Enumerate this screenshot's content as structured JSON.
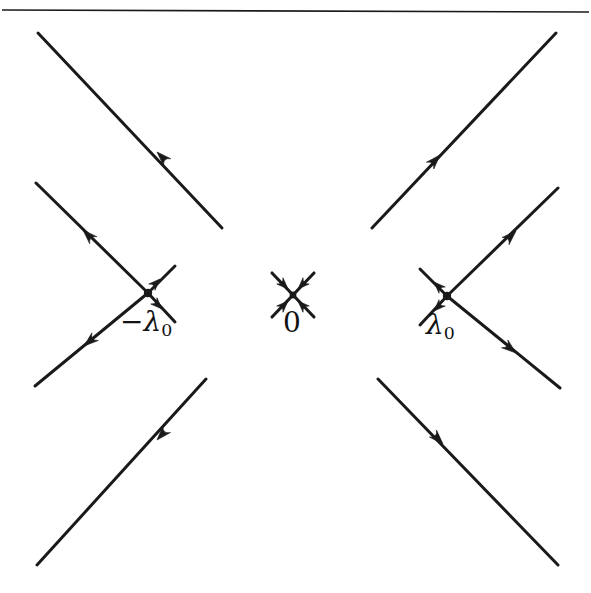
{
  "figure": {
    "type": "phase-line-diagram",
    "background_color": "#ffffff",
    "stroke_color": "#1a1a1a",
    "canvas": {
      "width": 591,
      "height": 593
    },
    "top_rule": {
      "name": "top-horizontal-rule",
      "x1": 2,
      "y1": 10,
      "x2": 589,
      "y2": 12,
      "thickness": 1.6
    }
  },
  "labels": {
    "neg_lambda": {
      "minus": "−",
      "lambda": "λ",
      "sub": "0",
      "text": "−λ₀"
    },
    "zero": {
      "text": "0"
    },
    "pos_lambda": {
      "lambda": "λ",
      "sub": "0",
      "text": "λ₀"
    }
  },
  "chart_data": {
    "type": "scatter",
    "title": "",
    "xlabel": "",
    "ylabel": "",
    "singular_points": [
      {
        "name": "-lambda0",
        "label": "−λ₀",
        "x": 148,
        "y": 293,
        "kind": "saddle"
      },
      {
        "name": "zero",
        "label": "0",
        "x": 293,
        "y": 295,
        "kind": "stable-node"
      },
      {
        "name": "lambda0",
        "label": "λ₀",
        "x": 447,
        "y": 296,
        "kind": "saddle"
      }
    ],
    "lines": [
      {
        "name": "upper-left-outer",
        "x1": 38,
        "y1": 33,
        "x2": 222,
        "y2": 228
      },
      {
        "name": "left-upper-arm",
        "x1": 36,
        "y1": 183,
        "x2": 148,
        "y2": 293
      },
      {
        "name": "left-lower-arm",
        "x1": 148,
        "y1": 293,
        "x2": 35,
        "y2": 386
      },
      {
        "name": "lower-left-outer",
        "x1": 206,
        "y1": 379,
        "x2": 37,
        "y2": 565
      },
      {
        "name": "upper-right-outer",
        "x1": 556,
        "y1": 33,
        "x2": 372,
        "y2": 228
      },
      {
        "name": "right-upper-arm",
        "x1": 558,
        "y1": 188,
        "x2": 447,
        "y2": 296
      },
      {
        "name": "right-lower-arm",
        "x1": 447,
        "y1": 296,
        "x2": 560,
        "y2": 388
      },
      {
        "name": "lower-right-outer",
        "x1": 378,
        "y1": 379,
        "x2": 558,
        "y2": 565
      },
      {
        "name": "center-cross-nw-se",
        "x1": 272,
        "y1": 273,
        "x2": 314,
        "y2": 317
      },
      {
        "name": "center-cross-ne-sw",
        "x1": 314,
        "y1": 273,
        "x2": 272,
        "y2": 317
      },
      {
        "name": "left-point-stub-ne",
        "x1": 148,
        "y1": 293,
        "x2": 175,
        "y2": 266
      },
      {
        "name": "left-point-stub-se",
        "x1": 148,
        "y1": 293,
        "x2": 175,
        "y2": 322
      },
      {
        "name": "right-point-stub-nw",
        "x1": 447,
        "y1": 296,
        "x2": 420,
        "y2": 269
      },
      {
        "name": "right-point-stub-sw",
        "x1": 447,
        "y1": 296,
        "x2": 420,
        "y2": 325
      }
    ],
    "arrows": [
      {
        "name": "arrow-upper-left-outer",
        "x": 157,
        "y": 152,
        "angle": -135
      },
      {
        "name": "arrow-left-upper-arm",
        "x": 83,
        "y": 230,
        "angle": -135
      },
      {
        "name": "arrow-left-lower-arm",
        "x": 84,
        "y": 346,
        "angle": 140
      },
      {
        "name": "arrow-lower-left-outer",
        "x": 157,
        "y": 440,
        "angle": 132
      },
      {
        "name": "arrow-upper-right-outer",
        "x": 440,
        "y": 155,
        "angle": -47
      },
      {
        "name": "arrow-right-upper-arm",
        "x": 516,
        "y": 231,
        "angle": -44
      },
      {
        "name": "arrow-right-lower-arm",
        "x": 516,
        "y": 353,
        "angle": 39
      },
      {
        "name": "arrow-lower-right-outer",
        "x": 443,
        "y": 444,
        "angle": 46
      },
      {
        "name": "arrow-center-nw-in",
        "x": 288,
        "y": 289,
        "angle": 45
      },
      {
        "name": "arrow-center-ne-in",
        "x": 298,
        "y": 289,
        "angle": 135
      },
      {
        "name": "arrow-center-sw-in",
        "x": 288,
        "y": 301,
        "angle": -45
      },
      {
        "name": "arrow-center-se-in",
        "x": 298,
        "y": 301,
        "angle": -135
      },
      {
        "name": "arrow-left-stub-up",
        "x": 160,
        "y": 279,
        "angle": -45
      },
      {
        "name": "arrow-left-stub-down",
        "x": 162,
        "y": 309,
        "angle": 45
      },
      {
        "name": "arrow-right-stub-up",
        "x": 434,
        "y": 282,
        "angle": -135
      },
      {
        "name": "arrow-right-stub-down",
        "x": 434,
        "y": 311,
        "angle": 135
      }
    ]
  }
}
